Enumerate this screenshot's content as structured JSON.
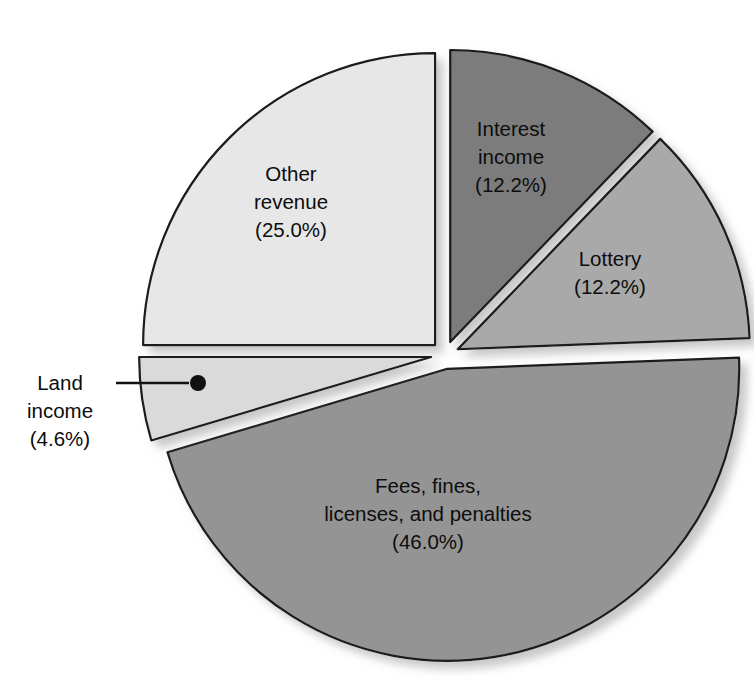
{
  "chart_data": {
    "type": "pie",
    "title": "",
    "subtitle": "",
    "xlabel": "",
    "ylabel": "",
    "legend_position": "none",
    "labels_inside_slices": true,
    "exploded": true,
    "categories": [
      "Other revenue",
      "Interest income",
      "Lottery",
      "Fees, fines, licenses, and penalties",
      "Land income"
    ],
    "values": [
      25.0,
      12.2,
      12.2,
      46.0,
      4.6
    ],
    "units": "percent",
    "slices": [
      {
        "name": "other-revenue",
        "label_line1": "Other",
        "label_line2": "revenue",
        "value_text": "(25.0%)",
        "value": 25.0,
        "color": "#e7e7e7",
        "start_angle_deg": 270,
        "end_angle_deg": 360,
        "callout": false
      },
      {
        "name": "interest-income",
        "label_line1": "Interest",
        "label_line2": "income",
        "value_text": "(12.2%)",
        "value": 12.2,
        "color": "#7b7b7b",
        "start_angle_deg": 0,
        "end_angle_deg": 43.9,
        "callout": false
      },
      {
        "name": "lottery",
        "label_line1": "Lottery",
        "label_line2": "",
        "value_text": "(12.2%)",
        "value": 12.2,
        "color": "#a9a9a9",
        "start_angle_deg": 43.9,
        "end_angle_deg": 87.8,
        "callout": false
      },
      {
        "name": "fees-fines-licenses-penalties",
        "label_line1": "Fees, fines,",
        "label_line2": "licenses, and penalties",
        "value_text": "(46.0%)",
        "value": 46.0,
        "color": "#949494",
        "start_angle_deg": 87.8,
        "end_angle_deg": 253.4,
        "callout": false
      },
      {
        "name": "land-income",
        "label_line1": "Land",
        "label_line2": "income",
        "value_text": "(4.6%)",
        "value": 4.6,
        "color": "#dadada",
        "start_angle_deg": 253.4,
        "end_angle_deg": 270,
        "callout": true
      }
    ],
    "colors": {
      "other_revenue": "#e7e7e7",
      "interest_income": "#7b7b7b",
      "lottery": "#a9a9a9",
      "fees_fines": "#949494",
      "land_income": "#dadada",
      "outline": "#1a1a1a",
      "background": "#ffffff",
      "label_text": "#0d0d0d"
    }
  }
}
